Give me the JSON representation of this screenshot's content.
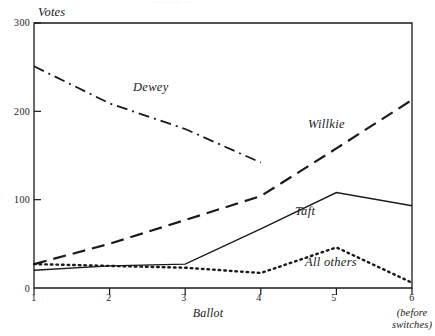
{
  "figure": {
    "top_fragment": "....  ..  ....  ...",
    "axis": {
      "y_title": "Votes",
      "x_title": "Ballot",
      "x_note_line1": "(before",
      "x_note_line2": "switches)"
    }
  },
  "chart_data": {
    "type": "line",
    "title": "",
    "xlabel": "Ballot",
    "ylabel": "Votes",
    "x": [
      1,
      2,
      3,
      4,
      5,
      6
    ],
    "xticklabels": [
      "1",
      "2",
      "3",
      "4",
      "5",
      "6"
    ],
    "yticklabels": [
      "0",
      "100",
      "200",
      "300"
    ],
    "yticks": [
      0,
      100,
      200,
      300
    ],
    "ylim": [
      0,
      300
    ],
    "xlim": [
      1,
      6
    ],
    "grid": false,
    "legend": "inline-annotations",
    "x_note": "(before switches)",
    "series": [
      {
        "name": "Dewey",
        "style": "dash-dot",
        "color": "#1a1a1a",
        "values": [
          251,
          209,
          180,
          142,
          null,
          null
        ],
        "label_x": 2.45,
        "label_y": 235
      },
      {
        "name": "Willkie",
        "style": "long-dash",
        "color": "#1a1a1a",
        "values": [
          27,
          50,
          77,
          104,
          158,
          213
        ],
        "label_x": 4.7,
        "label_y": 183
      },
      {
        "name": "Taft",
        "style": "solid",
        "color": "#1a1a1a",
        "values": [
          20,
          25,
          27,
          67,
          108,
          93
        ],
        "label_x": 4.6,
        "label_y": 80
      },
      {
        "name": "All others",
        "style": "dotted",
        "color": "#1a1a1a",
        "values": [
          27,
          25,
          23,
          17,
          46,
          6
        ],
        "label_x": 4.7,
        "label_y": 30
      }
    ]
  },
  "labels": {
    "dewey": "Dewey",
    "willkie": "Willkie",
    "taft": "Taft",
    "all_others": "All others",
    "y_title": "Votes",
    "x_title": "Ballot",
    "y_300": "300",
    "y_200": "200",
    "y_100": "100",
    "y_0": "0",
    "x_1": "1",
    "x_2": "2",
    "x_3": "3",
    "x_4": "4",
    "x_5": "5",
    "x_6": "6",
    "note_before": "(before",
    "note_switches": "switches)"
  }
}
